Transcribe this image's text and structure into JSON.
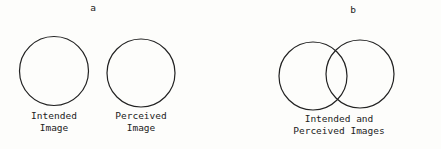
{
  "panels": [
    {
      "label": "a",
      "circles": [
        {
          "caption_line1": "Intended",
          "caption_line2": "Image"
        },
        {
          "caption_line1": "Perceived",
          "caption_line2": "Image"
        }
      ]
    },
    {
      "label": "b",
      "caption_line1": "Intended and",
      "caption_line2": "Perceived Images"
    }
  ],
  "colors": {
    "stroke": "#222222",
    "background": "#fdfdfb"
  }
}
